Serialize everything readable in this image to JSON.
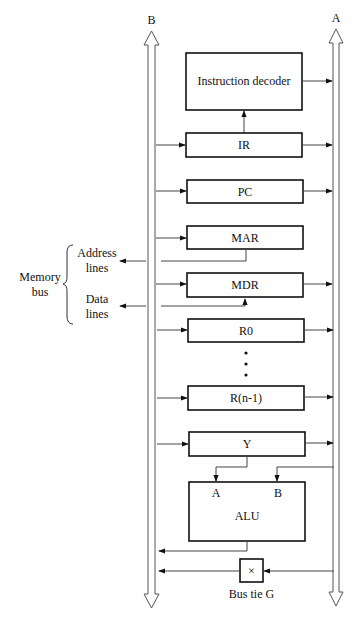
{
  "diagram": {
    "buses": {
      "left": {
        "label": "B"
      },
      "right": {
        "label": "A"
      }
    },
    "blocks": {
      "decoder": {
        "label": "Instruction decoder"
      },
      "ir": {
        "label": "IR"
      },
      "pc": {
        "label": "PC"
      },
      "mar": {
        "label": "MAR"
      },
      "mdr": {
        "label": "MDR"
      },
      "r0": {
        "label": "R0"
      },
      "rn1": {
        "label": "R(n-1)"
      },
      "y": {
        "label": "Y"
      },
      "alu": {
        "label": "ALU",
        "input_a": "A",
        "input_b": "B"
      },
      "bus_tie": {
        "label": "Bus tie G",
        "symbol": "×"
      }
    },
    "memory_bus": {
      "label_line1": "Memory",
      "label_line2": "bus",
      "address_line1": "Address",
      "address_line2": "lines",
      "data_line1": "Data",
      "data_line2": "lines"
    },
    "ellipsis": "⋮"
  }
}
